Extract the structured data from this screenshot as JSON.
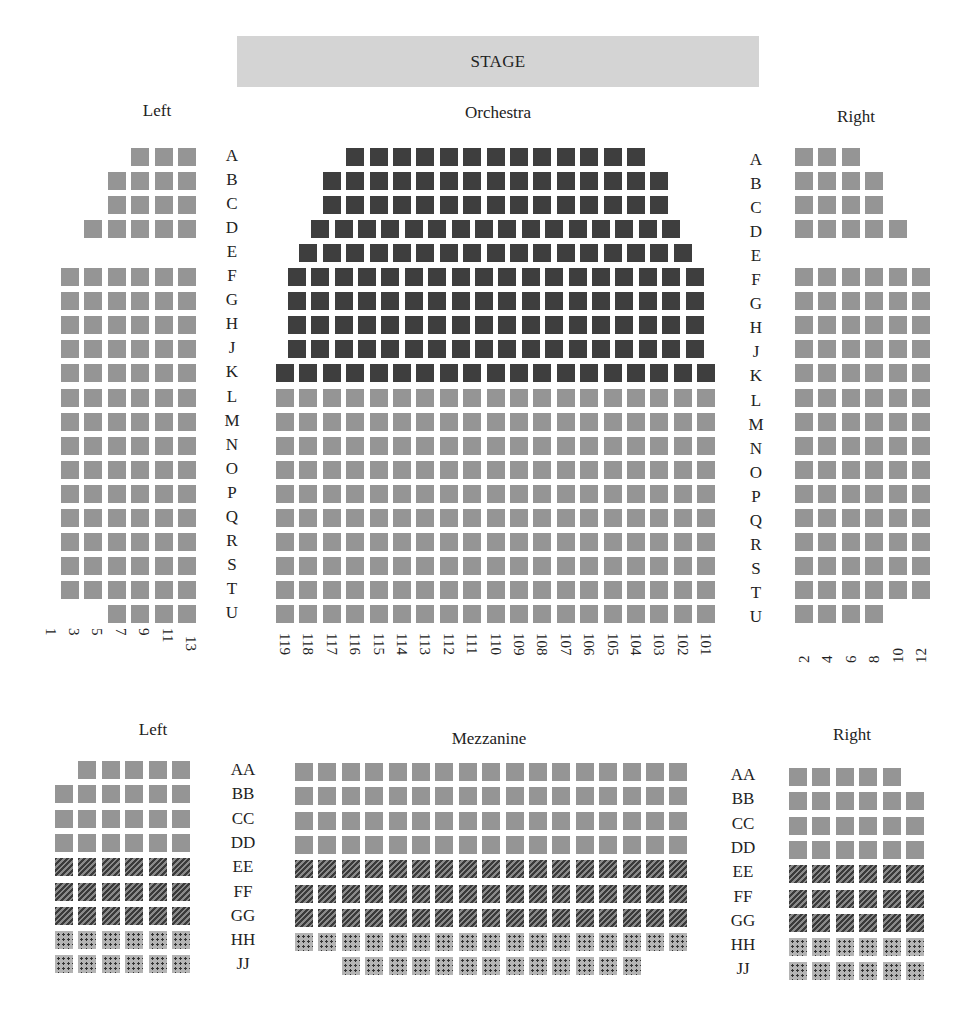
{
  "stage": {
    "label": "STAGE"
  },
  "orchestra": {
    "titles": {
      "left": "Left",
      "center": "Orchestra",
      "right": "Right"
    },
    "row_labels": [
      "A",
      "B",
      "C",
      "D",
      "E",
      "F",
      "G",
      "H",
      "J",
      "K",
      "L",
      "M",
      "N",
      "O",
      "P",
      "Q",
      "R",
      "S",
      "T",
      "U"
    ],
    "left": {
      "seat_counts": [
        3,
        4,
        4,
        5,
        0,
        6,
        6,
        6,
        6,
        6,
        6,
        6,
        6,
        6,
        6,
        6,
        6,
        6,
        6,
        4
      ],
      "seat_numbers": [
        "13",
        "11",
        "9",
        "7",
        "5",
        "3",
        "1"
      ]
    },
    "center": {
      "seat_counts": [
        13,
        15,
        15,
        16,
        17,
        18,
        18,
        18,
        18,
        19,
        19,
        19,
        19,
        19,
        19,
        19,
        19,
        19,
        19,
        19
      ],
      "premium_rows": [
        "A",
        "B",
        "C",
        "D",
        "E",
        "F",
        "G",
        "H",
        "J",
        "K"
      ],
      "seat_numbers": [
        "119",
        "118",
        "117",
        "116",
        "115",
        "114",
        "113",
        "112",
        "111",
        "110",
        "109",
        "108",
        "107",
        "106",
        "105",
        "104",
        "103",
        "102",
        "101"
      ]
    },
    "right": {
      "seat_counts": [
        3,
        4,
        4,
        5,
        0,
        6,
        6,
        6,
        6,
        6,
        6,
        6,
        6,
        6,
        6,
        6,
        6,
        6,
        6,
        4
      ],
      "seat_numbers": [
        "2",
        "4",
        "6",
        "8",
        "10",
        "12"
      ]
    }
  },
  "mezzanine": {
    "titles": {
      "left": "Left",
      "center": "Mezzanine",
      "right": "Right"
    },
    "row_labels": [
      "AA",
      "BB",
      "CC",
      "DD",
      "EE",
      "FF",
      "GG",
      "HH",
      "JJ"
    ],
    "row_styles": [
      "standard",
      "standard",
      "standard",
      "standard",
      "hatched",
      "hatched",
      "hatched",
      "dotted",
      "dotted"
    ],
    "left": {
      "seat_counts": [
        5,
        6,
        6,
        6,
        6,
        6,
        6,
        6,
        6
      ]
    },
    "center": {
      "seat_counts": [
        17,
        17,
        17,
        17,
        17,
        17,
        17,
        17,
        13
      ]
    },
    "right": {
      "seat_counts": [
        5,
        6,
        6,
        6,
        6,
        6,
        6,
        6,
        6
      ]
    }
  },
  "colors": {
    "stage": "#d4d4d4",
    "premium_seat": "#3e3e3e",
    "standard_seat": "#959595",
    "hatched_seat": "#3a3a3a",
    "dotted_seat": "#b4b4b4"
  }
}
